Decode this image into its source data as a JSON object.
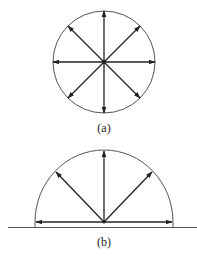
{
  "figures": [
    {
      "id": "a",
      "caption": "(a)",
      "shape": "full-circle",
      "arrow_directions_deg": [
        0,
        45,
        90,
        135,
        180,
        225,
        270,
        315
      ]
    },
    {
      "id": "b",
      "caption": "(b)",
      "shape": "semicircle-on-surface",
      "arrow_directions_deg": [
        0,
        45,
        90,
        135,
        180
      ]
    }
  ],
  "colors": {
    "stroke": "#222222",
    "circle": "#555555"
  }
}
